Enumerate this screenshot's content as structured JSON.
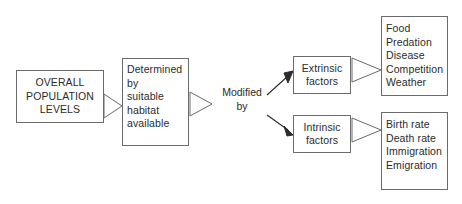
{
  "diagram": {
    "background_color": "#ffffff",
    "stroke_color": "#6b6b6b",
    "text_color": "#2b2b2b",
    "nodes": [
      {
        "id": "population",
        "lines": [
          "OVERALL",
          "POPULATION",
          "LEVELS"
        ]
      },
      {
        "id": "determined",
        "lines": [
          "Determined",
          "by",
          "suitable",
          "habitat",
          "available"
        ]
      },
      {
        "id": "extrinsic",
        "lines": [
          "Extrinsic",
          "factors"
        ]
      },
      {
        "id": "intrinsic",
        "lines": [
          "Intrinsic",
          "factors"
        ]
      },
      {
        "id": "extrinsic_list",
        "lines": [
          "Food",
          "Predation",
          "Disease",
          "Competition",
          "Weather"
        ]
      },
      {
        "id": "intrinsic_list",
        "lines": [
          "Birth rate",
          "Death rate",
          "Immigration",
          "Emigration"
        ]
      }
    ],
    "edge_labels": [
      {
        "id": "modified_by",
        "lines": [
          "Modified",
          "by"
        ]
      }
    ],
    "connectors": [
      {
        "id": "population-to-determined",
        "style": "hollow-triangle"
      },
      {
        "id": "determined-to-modified",
        "style": "hollow-triangle"
      },
      {
        "id": "modified-to-extrinsic",
        "style": "solid-arrow"
      },
      {
        "id": "modified-to-intrinsic",
        "style": "solid-arrow"
      },
      {
        "id": "extrinsic-to-extrinsic-list",
        "style": "hollow-triangle"
      },
      {
        "id": "intrinsic-to-intrinsic-list",
        "style": "hollow-triangle"
      }
    ]
  }
}
